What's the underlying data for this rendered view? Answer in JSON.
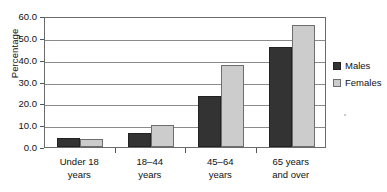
{
  "chart_data": {
    "type": "bar",
    "title": "",
    "xlabel": "",
    "ylabel": "Percentage",
    "ylim": [
      0,
      60
    ],
    "yticks": [
      "0.0",
      "10.0",
      "20.0",
      "30.0",
      "40.0",
      "50.0",
      "60.0"
    ],
    "grid": true,
    "legend_position": "right",
    "categories": [
      "Under 18 years",
      "18–44 years",
      "45–64 years",
      "65 years and over"
    ],
    "category_lines": [
      [
        "Under 18",
        "years"
      ],
      [
        "18–44",
        "years"
      ],
      [
        "45–64",
        "years"
      ],
      [
        "65 years",
        "and over"
      ]
    ],
    "series": [
      {
        "name": "Males",
        "color": "#333333",
        "values": [
          4.0,
          6.5,
          23.5,
          46.0
        ]
      },
      {
        "name": "Females",
        "color": "#cccccc",
        "values": [
          3.8,
          10.0,
          37.5,
          56.0
        ]
      }
    ]
  },
  "legend": {
    "items": [
      {
        "label": "Males",
        "swatch": "males"
      },
      {
        "label": "Females",
        "swatch": "females"
      }
    ]
  }
}
